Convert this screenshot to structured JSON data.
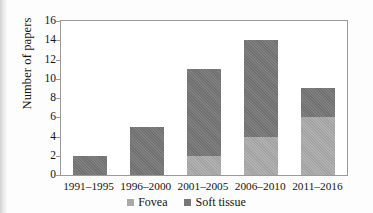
{
  "chart_data": {
    "type": "bar",
    "subtype": "stacked-bar",
    "title": "",
    "xlabel": "",
    "ylabel": "Number of papers",
    "categories": [
      "1991–1995",
      "1996–2000",
      "2001–2005",
      "2006–2010",
      "2011–2016"
    ],
    "series": [
      {
        "name": "Fovea",
        "color": "#a9a9a9",
        "values": [
          0,
          0,
          2,
          4,
          6
        ]
      },
      {
        "name": "Soft tissue",
        "color": "#767676",
        "values": [
          2,
          5,
          9,
          10,
          3
        ]
      }
    ],
    "totals": [
      2,
      5,
      11,
      14,
      9
    ],
    "ylim": [
      0,
      16
    ],
    "ytick_values": [
      0,
      2,
      4,
      6,
      8,
      10,
      12,
      14,
      16
    ],
    "ytick_labels": [
      "0",
      "2",
      "4",
      "6",
      "8",
      "10",
      "12",
      "14",
      "16"
    ],
    "grid": false,
    "legend_position": "bottom",
    "legend_entries": [
      "Fovea",
      "Soft tissue"
    ]
  },
  "axes": {
    "y_title": "Number of papers"
  }
}
